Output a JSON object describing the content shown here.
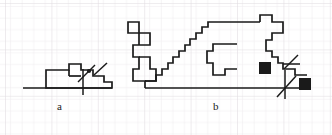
{
  "figure": {
    "width": 332,
    "height": 135,
    "background_color": "#ffffff",
    "ink_color": "#1a1a1a",
    "grid": {
      "visible": true,
      "cell_size": 11.6,
      "line_color": "#ebe7ea",
      "line_width": 1,
      "major_line_color": "#dedade",
      "major_every": 4,
      "origin_x": 5,
      "origin_y": 3
    },
    "labels": [
      {
        "id": "a",
        "text": "a",
        "x": 57,
        "y": 101
      },
      {
        "id": "b",
        "text": "b",
        "x": 213,
        "y": 101
      }
    ],
    "shapes": [
      {
        "id": "shape-a",
        "label": "a",
        "type": "rectilinear-polygon",
        "stroke_width": 1.6,
        "baseline": {
          "x1": 23,
          "y1": 88,
          "x2": 112,
          "y2": 88
        },
        "outline_points": [
          [
            46,
            88
          ],
          [
            46,
            70
          ],
          [
            69,
            70
          ],
          [
            69,
            64
          ],
          [
            81,
            64
          ],
          [
            81,
            70
          ],
          [
            93,
            70
          ],
          [
            93,
            76
          ],
          [
            104,
            76
          ],
          [
            104,
            82
          ],
          [
            112,
            82
          ],
          [
            112,
            88
          ],
          [
            46,
            88
          ]
        ],
        "inner_points": [
          [
            69,
            76
          ],
          [
            81,
            76
          ]
        ],
        "markers": [
          {
            "type": "dot",
            "x": 89,
            "y": 71,
            "r": 2.1
          }
        ],
        "angle_marks": [
          {
            "type": "tangent-arrow",
            "shaft": [
              [
                78,
                82
              ],
              [
                95,
                65
              ]
            ],
            "cross_v": [
              [
                83,
                95
              ],
              [
                83,
                69
              ]
            ]
          },
          {
            "type": "ray",
            "line": [
              [
                93,
                75
              ],
              [
                107,
                63
              ]
            ]
          }
        ]
      },
      {
        "id": "shape-b",
        "label": "b",
        "type": "rectilinear-polygon",
        "stroke_width": 1.6,
        "baseline": {
          "x1": 145,
          "y1": 88,
          "x2": 310,
          "y2": 88
        },
        "outline_points": [
          [
            145,
            88
          ],
          [
            145,
            81
          ],
          [
            133,
            81
          ],
          [
            133,
            69
          ],
          [
            139,
            69
          ],
          [
            139,
            57
          ],
          [
            133,
            57
          ],
          [
            133,
            45
          ],
          [
            139,
            45
          ],
          [
            139,
            33
          ],
          [
            128,
            33
          ],
          [
            128,
            22
          ],
          [
            139,
            22
          ],
          [
            139,
            33
          ],
          [
            150,
            33
          ],
          [
            150,
            45
          ],
          [
            139,
            45
          ],
          [
            139,
            57
          ],
          [
            150,
            57
          ],
          [
            150,
            69
          ],
          [
            156,
            69
          ],
          [
            156,
            81
          ],
          [
            145,
            81
          ]
        ],
        "staircase_points": [
          [
            145,
            81
          ],
          [
            156,
            81
          ],
          [
            156,
            75
          ],
          [
            162,
            75
          ],
          [
            162,
            69
          ],
          [
            168,
            69
          ],
          [
            168,
            63
          ],
          [
            173,
            63
          ],
          [
            173,
            57
          ],
          [
            179,
            57
          ],
          [
            179,
            51
          ],
          [
            185,
            51
          ],
          [
            185,
            45
          ],
          [
            190,
            45
          ],
          [
            190,
            39
          ],
          [
            196,
            39
          ],
          [
            196,
            33
          ],
          [
            202,
            33
          ],
          [
            202,
            27
          ],
          [
            208,
            27
          ],
          [
            208,
            22
          ],
          [
            260,
            22
          ]
        ],
        "upper_block_points": [
          [
            260,
            22
          ],
          [
            260,
            15
          ],
          [
            272,
            15
          ],
          [
            272,
            22
          ],
          [
            283,
            22
          ],
          [
            283,
            33
          ],
          [
            272,
            33
          ],
          [
            272,
            40
          ],
          [
            266,
            40
          ],
          [
            266,
            51
          ],
          [
            272,
            51
          ],
          [
            272,
            57
          ],
          [
            278,
            57
          ],
          [
            278,
            63
          ],
          [
            283,
            63
          ],
          [
            283,
            69
          ],
          [
            295,
            69
          ],
          [
            295,
            75
          ],
          [
            307,
            75
          ]
        ],
        "inner_shape_points": [
          [
            237,
            44
          ],
          [
            213,
            44
          ],
          [
            213,
            51
          ],
          [
            207,
            51
          ],
          [
            207,
            63
          ],
          [
            213,
            63
          ],
          [
            213,
            75
          ],
          [
            225,
            75
          ],
          [
            225,
            69
          ],
          [
            237,
            69
          ]
        ],
        "markers": [
          {
            "type": "filled-square",
            "x": 259,
            "y": 62,
            "size": 12
          },
          {
            "type": "filled-square",
            "x": 299,
            "y": 78,
            "size": 12
          }
        ],
        "angle_marks": [
          {
            "type": "tangent-arrow",
            "shaft": [
              [
                277,
                97
              ],
              [
                296,
                76
              ]
            ],
            "cross_v": [
              [
                285,
                99
              ],
              [
                285,
                70
              ]
            ]
          },
          {
            "type": "ray",
            "line": [
              [
                283,
                69
              ],
              [
                298,
                55
              ]
            ]
          },
          {
            "type": "ray",
            "line": [
              [
                283,
                63
              ],
              [
                299,
                63
              ]
            ]
          }
        ]
      }
    ]
  }
}
